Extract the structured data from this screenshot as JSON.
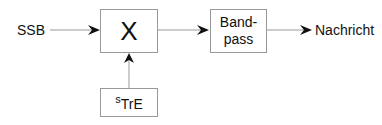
{
  "diagram": {
    "input_label": "SSB",
    "mixer_symbol": "X",
    "carrier_label_sup": "s",
    "carrier_label_main": "TrE",
    "bandpass_line1": "Band-",
    "bandpass_line2": "pass",
    "output_label": "Nachricht"
  }
}
